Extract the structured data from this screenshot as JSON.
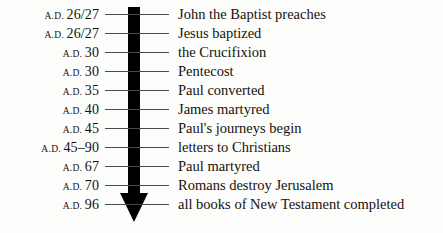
{
  "figure": {
    "axis_direction": "downward",
    "arrow_color": "#000000",
    "tick_color": "#4a4a4a",
    "background_color": "#fdfdfb",
    "text_color": "#15120f"
  },
  "rows": [
    {
      "era": "A.D.",
      "year": "26/27",
      "event": "John the Baptist preaches"
    },
    {
      "era": "A.D.",
      "year": "26/27",
      "event": "Jesus baptized"
    },
    {
      "era": "A.D.",
      "year": "30",
      "event": "the Crucifixion"
    },
    {
      "era": "A.D.",
      "year": "30",
      "event": "Pentecost"
    },
    {
      "era": "A.D.",
      "year": "35",
      "event": "Paul converted"
    },
    {
      "era": "A.D.",
      "year": "40",
      "event": "James martyred"
    },
    {
      "era": "A.D.",
      "year": "45",
      "event": "Paul's journeys begin"
    },
    {
      "era": "A.D.",
      "year": "45–90",
      "event": "letters to Christians"
    },
    {
      "era": "A.D.",
      "year": "67",
      "event": "Paul martyred"
    },
    {
      "era": "A.D.",
      "year": "70",
      "event": "Romans destroy Jerusalem"
    },
    {
      "era": "A.D.",
      "year": "96",
      "event": "all books of New Testament completed"
    }
  ]
}
